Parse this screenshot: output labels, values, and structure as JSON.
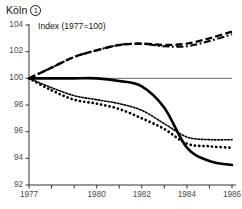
{
  "header": {
    "title": "Köln",
    "footnote_marker": "1"
  },
  "chart_data": {
    "type": "line",
    "title": "Köln",
    "subtitle": "Index (1977=100)",
    "xlabel": "",
    "ylabel": "",
    "xlim": [
      1977,
      1986
    ],
    "ylim": [
      92,
      104
    ],
    "yticks": [
      92,
      94,
      96,
      98,
      100,
      102,
      104
    ],
    "ytick_labels": [
      "92",
      "94",
      "96",
      "98",
      "100",
      "102",
      "104"
    ],
    "xticks": [
      1977,
      1978,
      1979,
      1980,
      1981,
      1982,
      1983,
      1984,
      1985,
      1986
    ],
    "xtick_labels": [
      "1977",
      "",
      "",
      "1980",
      "",
      "1982",
      "",
      "1984",
      "",
      "1986"
    ],
    "grid": false,
    "reference_line": 100,
    "legend": "none",
    "x": [
      1977,
      1978,
      1979,
      1980,
      1981,
      1982,
      1983,
      1984,
      1985,
      1986
    ],
    "series": [
      {
        "name": "dashed-upper",
        "style": "dashed",
        "values": [
          100.0,
          100.8,
          101.6,
          102.1,
          102.5,
          102.6,
          102.5,
          102.6,
          103.0,
          103.5
        ]
      },
      {
        "name": "dash-dot-upper",
        "style": "dash-dot",
        "values": [
          100.0,
          100.8,
          101.6,
          102.1,
          102.5,
          102.6,
          102.4,
          102.4,
          102.8,
          103.3
        ]
      },
      {
        "name": "solid-lower",
        "style": "solid",
        "values": [
          100.0,
          100.0,
          100.0,
          100.0,
          99.8,
          99.4,
          97.8,
          94.8,
          93.8,
          93.5
        ]
      },
      {
        "name": "fine-dotted",
        "style": "fine-dotted",
        "values": [
          100.0,
          99.3,
          98.7,
          98.4,
          98.1,
          97.6,
          96.6,
          95.6,
          95.4,
          95.4
        ]
      },
      {
        "name": "bold-dotted",
        "style": "bold-dotted",
        "values": [
          100.0,
          99.1,
          98.4,
          98.1,
          97.7,
          97.0,
          96.2,
          95.1,
          94.9,
          94.8
        ]
      }
    ]
  }
}
